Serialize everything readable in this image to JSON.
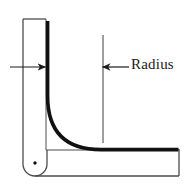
{
  "figure": {
    "type": "engineering-cross-section",
    "background_color": "#ffffff",
    "outline_color": "#4d4d4d",
    "thick_line_color": "#111111",
    "annotation_color": "#1a1a1a",
    "labels": {
      "radius": "Radius"
    },
    "annotations": [
      {
        "name": "thickness-arrow",
        "direction": "right",
        "x1": 10,
        "y1": 67,
        "x2": 47,
        "y2": 67
      },
      {
        "name": "radius-arrow",
        "direction": "left",
        "x1": 129,
        "y1": 67,
        "x2": 101,
        "y2": 67
      },
      {
        "name": "radius-leader-line",
        "x": 103,
        "y1": 35,
        "y2": 143
      }
    ],
    "geometry": {
      "vertical_leg": {
        "left": 23,
        "right": 46,
        "top": 19,
        "bottom": 176,
        "rounded_bottom": true
      },
      "horizontal_leg": {
        "left": 46,
        "right": 178,
        "top": 150,
        "bottom": 176
      },
      "inner_radius_curve": {
        "start_x": 47,
        "start_y": 22,
        "corner_x": 47,
        "corner_y": 150,
        "end_x": 178,
        "end_y": 150,
        "stroke_width": 3.6
      },
      "center_point_marker": {
        "x": 35,
        "y": 163,
        "radius": 1.6
      }
    }
  }
}
